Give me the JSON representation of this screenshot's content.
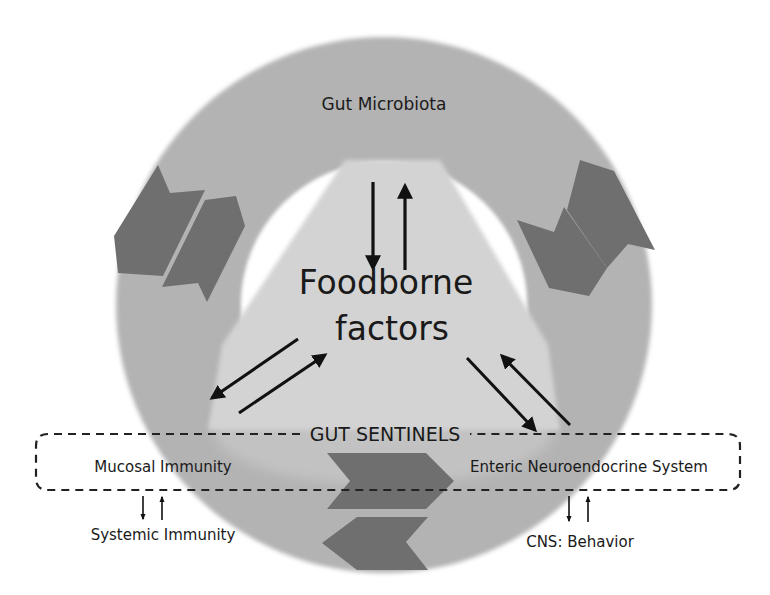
{
  "diagram": {
    "ring_label": "Gut Microbiota",
    "center_label_line1": "Foodborne",
    "center_label_line2": "factors",
    "sentinels_label": "GUT SENTINELS",
    "left_node": "Mucosal Immunity",
    "right_node": "Enteric Neuroendocrine System",
    "left_outcome": "Systemic Immunity",
    "right_outcome": "CNS: Behavior"
  },
  "colors": {
    "ring": "#b3b3b3",
    "inner_light": "#d4d4d4",
    "chevron": "#6f6f6f",
    "text": "#1a1a1a",
    "arrow": "#111111",
    "background": "#ffffff"
  },
  "relations": [
    {
      "from": "Gut Microbiota",
      "to": "Foodborne factors",
      "direction": "bidirectional"
    },
    {
      "from": "Foodborne factors",
      "to": "Mucosal Immunity",
      "direction": "bidirectional"
    },
    {
      "from": "Foodborne factors",
      "to": "Enteric Neuroendocrine System",
      "direction": "bidirectional"
    },
    {
      "from": "Mucosal Immunity",
      "to": "Systemic Immunity",
      "direction": "bidirectional"
    },
    {
      "from": "Enteric Neuroendocrine System",
      "to": "CNS: Behavior",
      "direction": "bidirectional"
    }
  ]
}
